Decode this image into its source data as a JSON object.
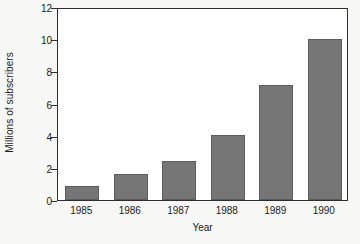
{
  "chart_data": {
    "type": "bar",
    "title": "",
    "xlabel": "Year",
    "ylabel": "Millions of subscribers",
    "categories": [
      "1985",
      "1986",
      "1987",
      "1988",
      "1989",
      "1990"
    ],
    "values": [
      0.85,
      1.6,
      2.45,
      4.05,
      7.15,
      10.0
    ],
    "ylim": [
      0,
      12
    ],
    "yticks": [
      0,
      2,
      4,
      6,
      8,
      10,
      12
    ],
    "ytick_labels": [
      "0",
      "2",
      "4",
      "6",
      "8",
      "10",
      "12"
    ],
    "grid": false,
    "legend": "none",
    "bar_color": "#767676",
    "bar_edge_color": "#5c5c5c",
    "axis_color": "#2e2e2e",
    "plot_background": "#ffffff",
    "figure_background": "#f7f7f5",
    "text_color": "#1b1b1b"
  }
}
